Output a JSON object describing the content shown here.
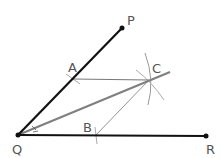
{
  "diagram": {
    "points": {
      "P": {
        "label": "P",
        "x": 122,
        "y": 28
      },
      "Q": {
        "label": "Q",
        "x": 18,
        "y": 135
      },
      "R": {
        "label": "R",
        "x": 206,
        "y": 136
      },
      "A": {
        "label": "A",
        "x": 73,
        "y": 79
      },
      "B": {
        "label": "B",
        "x": 96,
        "y": 135
      },
      "C": {
        "label": "C",
        "x": 149,
        "y": 80
      }
    },
    "colors": {
      "rays": "#111111",
      "bisector": "#808080",
      "construction": "#777777",
      "arcs": "#999999",
      "labels": "#555555"
    }
  }
}
